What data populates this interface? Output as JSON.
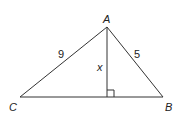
{
  "diagram": {
    "type": "triangle",
    "vertices": {
      "A": {
        "label": "A"
      },
      "B": {
        "label": "B"
      },
      "C": {
        "label": "C"
      }
    },
    "sides": {
      "AC": {
        "label": "9"
      },
      "AB": {
        "label": "5"
      }
    },
    "altitude": {
      "from": "A",
      "to_side": "CB",
      "label": "x",
      "right_angle_marker": true
    }
  },
  "colors": {
    "line": "#333333",
    "text": "#222222",
    "background": "#ffffff"
  }
}
